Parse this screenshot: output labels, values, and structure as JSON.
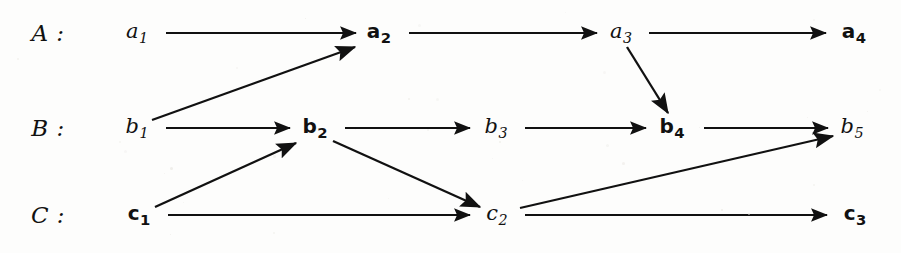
{
  "diagram": {
    "background_color": "#fdfdfc",
    "ink_color": "#111111",
    "width": 901,
    "height": 253,
    "rows": [
      {
        "id": "A",
        "label": "A :",
        "label_x": 48,
        "label_y": 33,
        "y": 33
      },
      {
        "id": "B",
        "label": "B :",
        "label_x": 48,
        "label_y": 128,
        "y": 128
      },
      {
        "id": "C",
        "label": "C :",
        "label_x": 48,
        "label_y": 215,
        "y": 215
      }
    ],
    "nodes": [
      {
        "id": "a1",
        "base": "a",
        "sub": "1",
        "style": "italic",
        "x": 137,
        "y": 33,
        "row": "A"
      },
      {
        "id": "a2",
        "base": "a",
        "sub": "2",
        "style": "bold",
        "x": 379,
        "y": 33,
        "row": "A"
      },
      {
        "id": "a3",
        "base": "a",
        "sub": "3",
        "style": "italic",
        "x": 621,
        "y": 33,
        "row": "A"
      },
      {
        "id": "a4",
        "base": "a",
        "sub": "4",
        "style": "bold",
        "x": 854,
        "y": 33,
        "row": "A"
      },
      {
        "id": "b1",
        "base": "b",
        "sub": "1",
        "style": "italic",
        "x": 137,
        "y": 128,
        "row": "B"
      },
      {
        "id": "b2",
        "base": "b",
        "sub": "2",
        "style": "bold",
        "x": 315,
        "y": 128,
        "row": "B"
      },
      {
        "id": "b3",
        "base": "b",
        "sub": "3",
        "style": "italic",
        "x": 496,
        "y": 128,
        "row": "B"
      },
      {
        "id": "b4",
        "base": "b",
        "sub": "4",
        "style": "bold",
        "x": 672,
        "y": 128,
        "row": "B"
      },
      {
        "id": "b5",
        "base": "b",
        "sub": "5",
        "style": "italic",
        "x": 852,
        "y": 128,
        "row": "B"
      },
      {
        "id": "c1",
        "base": "c",
        "sub": "1",
        "style": "bold",
        "x": 139,
        "y": 215,
        "row": "C"
      },
      {
        "id": "c2",
        "base": "c",
        "sub": "2",
        "style": "italic",
        "x": 497,
        "y": 215,
        "row": "C"
      },
      {
        "id": "c3",
        "base": "c",
        "sub": "3",
        "style": "bold",
        "x": 855,
        "y": 215,
        "row": "C"
      }
    ],
    "edges": [
      {
        "id": "a1-a2",
        "from": "a1",
        "to": "a2",
        "kind": "horizontal",
        "x1": 166,
        "y1": 33,
        "x2": 356,
        "y2": 33
      },
      {
        "id": "a2-a3",
        "from": "a2",
        "to": "a3",
        "kind": "horizontal",
        "x1": 409,
        "y1": 33,
        "x2": 597,
        "y2": 33
      },
      {
        "id": "a3-a4",
        "from": "a3",
        "to": "a4",
        "kind": "horizontal",
        "x1": 649,
        "y1": 33,
        "x2": 826,
        "y2": 33
      },
      {
        "id": "b1-b2",
        "from": "b1",
        "to": "b2",
        "kind": "horizontal",
        "x1": 166,
        "y1": 128,
        "x2": 290,
        "y2": 128
      },
      {
        "id": "b2-b3",
        "from": "b2",
        "to": "b3",
        "kind": "horizontal",
        "x1": 345,
        "y1": 128,
        "x2": 470,
        "y2": 128
      },
      {
        "id": "b3-b4",
        "from": "b3",
        "to": "b4",
        "kind": "horizontal",
        "x1": 525,
        "y1": 128,
        "x2": 646,
        "y2": 128
      },
      {
        "id": "b4-b5",
        "from": "b4",
        "to": "b5",
        "kind": "horizontal",
        "x1": 704,
        "y1": 128,
        "x2": 828,
        "y2": 128
      },
      {
        "id": "c1-c2",
        "from": "c1",
        "to": "c2",
        "kind": "horizontal",
        "x1": 168,
        "y1": 215,
        "x2": 470,
        "y2": 215
      },
      {
        "id": "c2-c3",
        "from": "c2",
        "to": "c3",
        "kind": "horizontal",
        "x1": 525,
        "y1": 215,
        "x2": 827,
        "y2": 215
      },
      {
        "id": "b1-a2",
        "from": "b1",
        "to": "a2",
        "kind": "diagonal-up",
        "x1": 152,
        "y1": 120,
        "x2": 355,
        "y2": 47
      },
      {
        "id": "a3-b4",
        "from": "a3",
        "to": "b4",
        "kind": "diagonal-down",
        "x1": 627,
        "y1": 47,
        "x2": 668,
        "y2": 113
      },
      {
        "id": "c1-b2",
        "from": "c1",
        "to": "b2",
        "kind": "diagonal-up",
        "x1": 155,
        "y1": 207,
        "x2": 296,
        "y2": 143
      },
      {
        "id": "b2-c2",
        "from": "b2",
        "to": "c2",
        "kind": "diagonal-down",
        "x1": 333,
        "y1": 141,
        "x2": 480,
        "y2": 207
      },
      {
        "id": "c2-b5",
        "from": "c2",
        "to": "b5",
        "kind": "diagonal-up",
        "x1": 520,
        "y1": 208,
        "x2": 833,
        "y2": 136
      }
    ]
  }
}
